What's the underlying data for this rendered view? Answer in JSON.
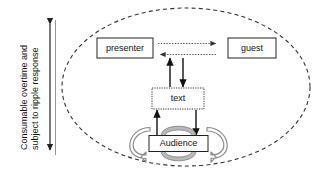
{
  "diagram": {
    "boundary": {
      "name": "system-boundary",
      "shape": "dashed-ellipse"
    },
    "axis": {
      "label_line1": "Consumable overtime and",
      "label_line2": "subject to ripple response",
      "arrow_style": "double-headed-vertical"
    },
    "nodes": [
      {
        "id": "presenter",
        "label": "presenter",
        "border": "solid"
      },
      {
        "id": "guest",
        "label": "guest",
        "border": "solid"
      },
      {
        "id": "text",
        "label": "text",
        "border": "dotted"
      },
      {
        "id": "audience",
        "label": "Audience",
        "border": "solid"
      }
    ],
    "edges": [
      {
        "id": "presenter-to-guest",
        "from": "presenter",
        "to": "guest",
        "style": "dotted",
        "direction": "right"
      },
      {
        "id": "guest-to-presenter",
        "from": "guest",
        "to": "presenter",
        "style": "dotted",
        "direction": "left"
      },
      {
        "id": "text-to-channel",
        "from": "text",
        "to": "channel",
        "style": "solid",
        "direction": "up"
      },
      {
        "id": "channel-to-text",
        "from": "channel",
        "to": "text",
        "style": "solid",
        "direction": "down"
      },
      {
        "id": "audience-to-text",
        "from": "audience",
        "to": "text",
        "style": "solid",
        "direction": "up"
      },
      {
        "id": "text-to-audience",
        "from": "text",
        "to": "audience",
        "style": "solid",
        "direction": "down"
      },
      {
        "id": "audience-ripple-left",
        "from": "audience",
        "to": "audience",
        "style": "loop",
        "direction": "ccw"
      },
      {
        "id": "audience-ripple-right",
        "from": "audience",
        "to": "audience",
        "style": "loop",
        "direction": "cw"
      }
    ],
    "colors": {
      "ink": "#111111",
      "boundary": "#333333",
      "dotted_flow": "#555555",
      "loop_fill": "#b9b9b9",
      "loop_stroke": "#8e8e8e",
      "background": "#ffffff"
    }
  }
}
